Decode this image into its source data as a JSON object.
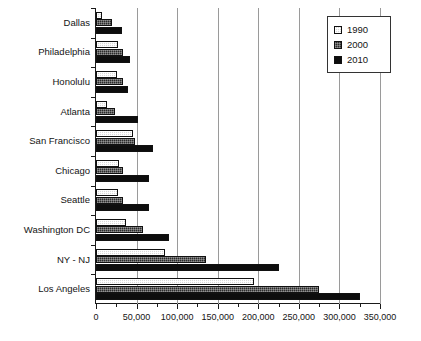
{
  "chart_data": {
    "type": "bar",
    "orientation": "horizontal",
    "title": "",
    "xlabel": "",
    "ylabel": "",
    "xlim": [
      0,
      350000
    ],
    "xticks": [
      0,
      50000,
      100000,
      150000,
      200000,
      250000,
      300000,
      350000
    ],
    "xtick_labels": [
      "0",
      "50,000",
      "100,000",
      "150,000",
      "200,000",
      "250,000",
      "300,000",
      "350,000"
    ],
    "minor_tick_interval": 25000,
    "grid": "vertical",
    "legend_position": "top-right",
    "categories": [
      "Dallas",
      "Philadelphia",
      "Honolulu",
      "Atlanta",
      "San Francisco",
      "Chicago",
      "Seattle",
      "Washington DC",
      "NY - NJ",
      "Los Angeles"
    ],
    "series": [
      {
        "name": "1990",
        "color": "#d9d9d9",
        "values": [
          8000,
          27000,
          26000,
          13000,
          45000,
          28000,
          27000,
          37000,
          85000,
          195000
        ]
      },
      {
        "name": "2000",
        "color": "#2b2b2b",
        "values": [
          20000,
          33000,
          33000,
          24000,
          48000,
          33000,
          33000,
          58000,
          135000,
          275000
        ]
      },
      {
        "name": "2010",
        "color": "#0d0d0d",
        "values": [
          32000,
          42000,
          40000,
          52000,
          70000,
          65000,
          65000,
          90000,
          225000,
          325000
        ]
      }
    ]
  },
  "legend": {
    "items": [
      {
        "label": "1990",
        "swatch": "1990"
      },
      {
        "label": "2000",
        "swatch": "2000"
      },
      {
        "label": "2010",
        "swatch": "2010"
      }
    ]
  }
}
